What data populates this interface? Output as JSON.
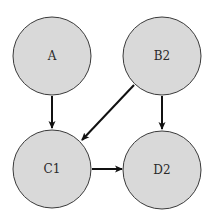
{
  "diagram": {
    "type": "directed-graph",
    "colors": {
      "node_fill": "#d9d9d9",
      "node_stroke": "#3a3a3a",
      "edge": "#111111",
      "background": "#ffffff"
    },
    "nodes": [
      {
        "id": "A",
        "label": "A",
        "cx": 52,
        "cy": 56,
        "r": 39
      },
      {
        "id": "B2",
        "label": "B2",
        "cx": 162,
        "cy": 56,
        "r": 39
      },
      {
        "id": "C1",
        "label": "C1",
        "cx": 52,
        "cy": 169,
        "r": 39
      },
      {
        "id": "D2",
        "label": "D2",
        "cx": 162,
        "cy": 170,
        "r": 39
      }
    ],
    "edges": [
      {
        "from": "A",
        "to": "C1"
      },
      {
        "from": "B2",
        "to": "C1"
      },
      {
        "from": "B2",
        "to": "D2"
      },
      {
        "from": "C1",
        "to": "D2"
      }
    ]
  }
}
